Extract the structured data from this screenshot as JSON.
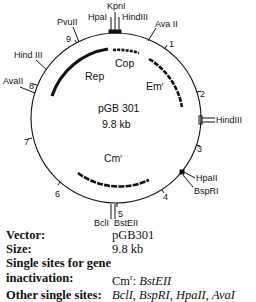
{
  "map": {
    "name": "pGB 301",
    "size": "9.8 kb",
    "scale_ticks": [
      "1",
      "2",
      "3",
      "4",
      "5",
      "6",
      "7",
      "8",
      "9"
    ],
    "genes": [
      {
        "name": "Rep",
        "label": "Rep"
      },
      {
        "name": "Cop",
        "label": "Cop"
      },
      {
        "name": "Em",
        "label": "Em",
        "sup": "r"
      },
      {
        "name": "Cm",
        "label": "Cm",
        "sup": "r"
      }
    ],
    "sites": {
      "kpni": "KpnI",
      "hpai": "HpaI",
      "hindiii_top": "HindIII",
      "avaii_top": "Ava II",
      "pvuii": "PvuII",
      "hindiii_left": "Hind III",
      "avaii_left": "AvaII",
      "hindiii_right": "HindIII",
      "hpaii": "HpaII",
      "bsprI": "BspRI",
      "bcli": "BclI",
      "bsteii": "BstEII"
    }
  },
  "info": {
    "vector_label": "Vector:",
    "vector_value": "pGB301",
    "size_label": "Size:",
    "size_value": "9.8 kb",
    "single_sites_label_1": "Single sites for gene",
    "single_sites_label_2": "inactivation:",
    "single_sites_value_prefix": "Cm",
    "single_sites_value_sup": "r",
    "single_sites_value_sep": ": ",
    "single_sites_value_site": "BstEII",
    "other_label": "Other single sites:",
    "other_sites": [
      "BclI",
      "BspRI",
      "HpaII",
      "AvaI"
    ]
  }
}
